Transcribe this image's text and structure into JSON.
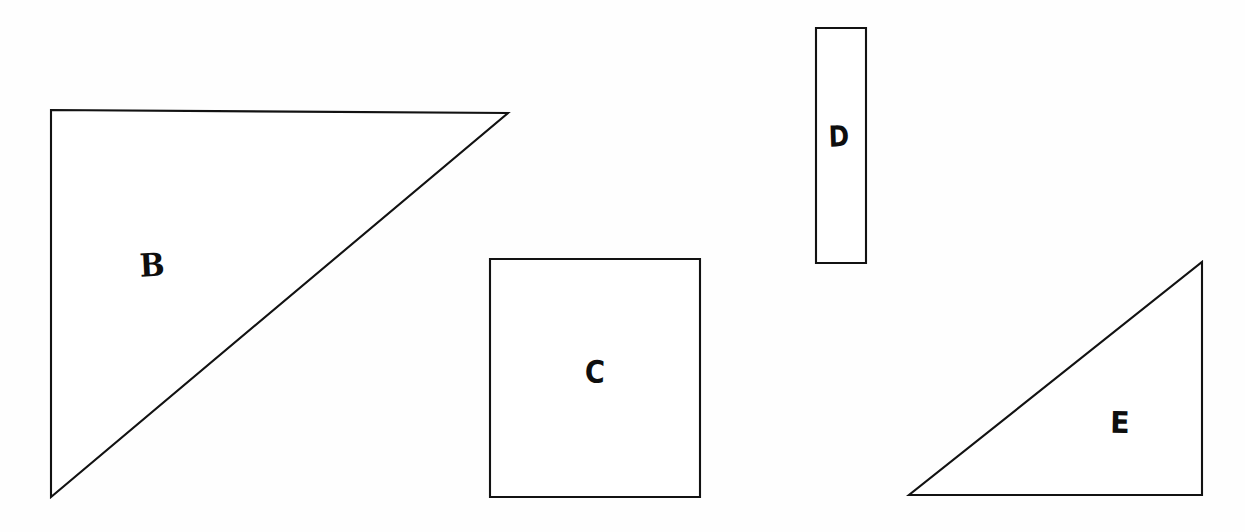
{
  "figure": {
    "background_color": "#fefefe",
    "stroke_color": "#121212",
    "width": 1245,
    "height": 532
  },
  "shapes": [
    {
      "id": "B",
      "label": "B",
      "kind": "right-triangle",
      "points": "51,110 508,113 51,497",
      "label_x": 152,
      "label_y": 265,
      "bbox": {
        "x": 51,
        "y": 110,
        "w": 457,
        "h": 387
      }
    },
    {
      "id": "C",
      "label": "C",
      "kind": "rectangle",
      "points": "490,259 700,259 700,497 490,497",
      "label_x": 595,
      "label_y": 372,
      "bbox": {
        "x": 490,
        "y": 259,
        "w": 210,
        "h": 238
      }
    },
    {
      "id": "D",
      "label": "D",
      "kind": "rectangle",
      "points": "816,28 866,28 866,263 816,263",
      "label_x": 839,
      "label_y": 137,
      "bbox": {
        "x": 816,
        "y": 28,
        "w": 50,
        "h": 235
      }
    },
    {
      "id": "E",
      "label": "E",
      "kind": "right-triangle",
      "points": "1202,262 1202,495 909,495",
      "label_x": 1120,
      "label_y": 423,
      "bbox": {
        "x": 909,
        "y": 262,
        "w": 293,
        "h": 233
      }
    }
  ]
}
